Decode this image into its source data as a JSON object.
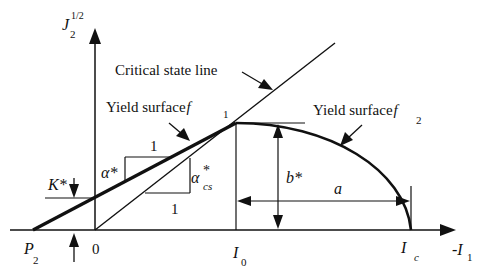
{
  "diagram": {
    "type": "yield-surface-schematic",
    "axes": {
      "y_label": {
        "main": "J",
        "sub": "2",
        "sup": "1/2"
      },
      "x_label": {
        "prefix": "-",
        "main": "I",
        "sub": "1"
      }
    },
    "labels": {
      "critical_state_line": "Critical state line",
      "yield_surface_f1": {
        "text": "Yield surface",
        "sym": "f",
        "sub": "1"
      },
      "yield_surface_f2": {
        "text": "Yield surface",
        "sym": "f",
        "sub": "2"
      },
      "alpha_star": "α*",
      "alpha_cs": {
        "main": "α",
        "sup": "*",
        "sub": "cs"
      },
      "one_upper": "1",
      "one_lower": "1",
      "k_star": "K*",
      "b_star": "b*",
      "a": "a"
    },
    "ticks": {
      "p2": {
        "main": "P",
        "sub": "2"
      },
      "origin": "0",
      "i0": {
        "main": "I",
        "sub": "0"
      },
      "ic": {
        "main": "I",
        "sub": "c"
      }
    },
    "colors": {
      "stroke": "#111111",
      "background": "#ffffff"
    }
  }
}
